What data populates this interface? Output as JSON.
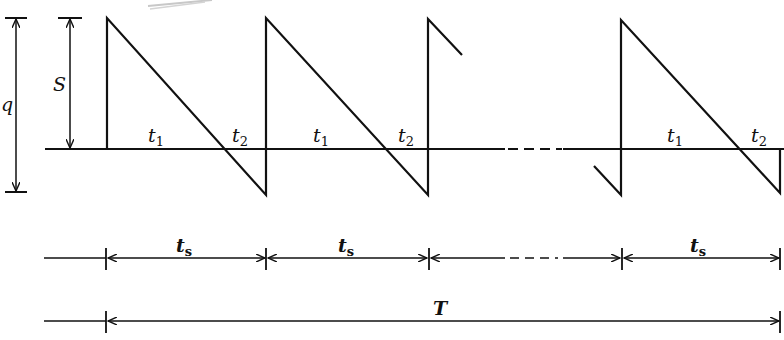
{
  "diagram": {
    "type": "sawtooth inventory diagram",
    "colors": {
      "line": "#111111",
      "background": "#ffffff"
    },
    "labels": {
      "q": "q",
      "S": "S",
      "t": "t",
      "sub_1": "1",
      "sub_2": "2",
      "sub_s": "s",
      "T": "T"
    },
    "cycles": [
      {
        "index": 1,
        "t1_label": "t",
        "t1_sub": "1",
        "t2_label": "t",
        "t2_sub": "2"
      },
      {
        "index": 2,
        "t1_label": "t",
        "t1_sub": "1",
        "t2_label": "t",
        "t2_sub": "2"
      },
      {
        "index": 3,
        "t1_label": "t",
        "t1_sub": "1",
        "t2_label": "t",
        "t2_sub": "2"
      }
    ],
    "dimensions": {
      "q_arrow": "Lot size q (max inventory S + max shortage)",
      "S_arrow": "Max inventory S",
      "ts_row": [
        "t_s",
        "t_s",
        "...",
        "t_s"
      ],
      "T_row": "T (total horizon)"
    }
  }
}
